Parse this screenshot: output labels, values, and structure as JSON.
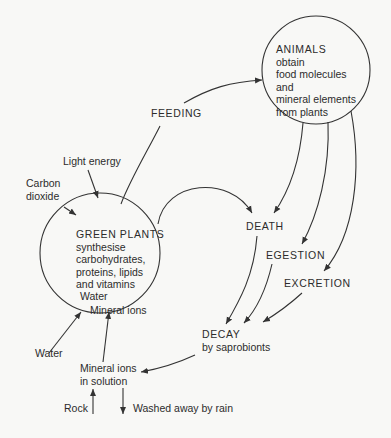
{
  "diagram": {
    "nodes": {
      "animals": {
        "heading": "ANIMALS",
        "lines": [
          "obtain",
          "food molecules",
          "and",
          "mineral elements",
          "from plants"
        ]
      },
      "green_plants": {
        "heading": "GREEN PLANTS",
        "lines": [
          "synthesise",
          "carbohydrates,",
          "proteins, lipids",
          "and vitamins"
        ],
        "inner_water": "Water",
        "inner_mineral_ions": "Mineral ions"
      },
      "death": "DEATH",
      "egestion": "EGESTION",
      "excretion": "EXCRETION",
      "decay": {
        "heading": "DECAY",
        "sub": "by saprobionts"
      },
      "mineral_ions_solution": [
        "Mineral ions",
        "in solution"
      ]
    },
    "labels": {
      "feeding": "FEEDING",
      "light_energy": "Light energy",
      "carbon_dioxide": [
        "Carbon",
        "dioxide"
      ],
      "water": "Water",
      "rock": "Rock",
      "washed_away": "Washed away by rain"
    },
    "edges": [
      {
        "from": "green_plants",
        "to": "animals",
        "label": "FEEDING"
      },
      {
        "from": "green_plants",
        "to": "death"
      },
      {
        "from": "animals",
        "to": "death"
      },
      {
        "from": "animals",
        "to": "egestion"
      },
      {
        "from": "animals",
        "to": "excretion"
      },
      {
        "from": "death",
        "to": "decay"
      },
      {
        "from": "egestion",
        "to": "decay"
      },
      {
        "from": "excretion",
        "to": "decay"
      },
      {
        "from": "decay",
        "to": "mineral_ions_solution"
      },
      {
        "from": "mineral_ions_solution",
        "to": "green_plants",
        "label": "Mineral ions"
      },
      {
        "from": "water",
        "to": "green_plants",
        "label": "Water"
      },
      {
        "from": "light_energy",
        "to": "green_plants"
      },
      {
        "from": "carbon_dioxide",
        "to": "green_plants"
      },
      {
        "from": "rock",
        "to": "mineral_ions_solution"
      },
      {
        "from": "mineral_ions_solution",
        "to": "washed_away"
      }
    ],
    "colors": {
      "line": "#333333",
      "text": "#2c2c2c",
      "background": "#f8f8f6"
    }
  }
}
